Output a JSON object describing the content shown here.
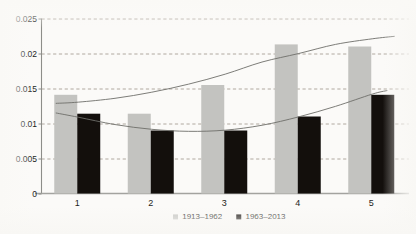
{
  "chart_data": {
    "type": "bar",
    "title": "",
    "subtitle": "",
    "xlabel": "",
    "ylabel": "",
    "categories": [
      "1",
      "2",
      "3",
      "4",
      "5"
    ],
    "series": [
      {
        "name": "1913–1962",
        "color": "#c3c3c0",
        "values": [
          0.0141,
          0.0114,
          0.0155,
          0.0213,
          0.021
        ]
      },
      {
        "name": "1963–2013",
        "color": "#130f0c",
        "values": [
          0.0114,
          0.009,
          0.009,
          0.011,
          0.0141
        ]
      }
    ],
    "trendlines": [
      {
        "name": "1913–1962 trend",
        "color": "#6e6e6a",
        "points": [
          [
            0.7,
            0.01288
          ],
          [
            1.0,
            0.01305
          ],
          [
            1.5,
            0.0136
          ],
          [
            2.0,
            0.01447
          ],
          [
            2.5,
            0.01562
          ],
          [
            3.0,
            0.01705
          ],
          [
            3.5,
            0.01878
          ],
          [
            4.0,
            0.02
          ],
          [
            4.5,
            0.0213
          ],
          [
            5.0,
            0.0221
          ],
          [
            5.3,
            0.02245
          ]
        ]
      },
      {
        "name": "1963–2013 trend",
        "color": "#6e6e6a",
        "points": [
          [
            0.7,
            0.0115
          ],
          [
            1.0,
            0.0109
          ],
          [
            1.5,
            0.00985
          ],
          [
            2.0,
            0.00917
          ],
          [
            2.5,
            0.00888
          ],
          [
            3.0,
            0.00905
          ],
          [
            3.5,
            0.00975
          ],
          [
            4.0,
            0.01095
          ],
          [
            4.5,
            0.01245
          ],
          [
            5.0,
            0.0142
          ],
          [
            5.2,
            0.0147
          ]
        ]
      }
    ],
    "ylim": [
      0,
      0.025
    ],
    "yticks": [
      0,
      0.005,
      0.01,
      0.015,
      0.02,
      0.025
    ],
    "ytick_labels": [
      "0",
      "0.005",
      "0.01",
      "0.015",
      "0.02",
      "0.025"
    ],
    "grid": true,
    "grid_style": "dashed-horizontal",
    "grid_color": "#9a9287",
    "axis_color": "#8d8d89",
    "legend_position": "bottom-center",
    "legend": [
      "1913–1962",
      "1963–2013"
    ],
    "background": "#fbfaf8"
  }
}
